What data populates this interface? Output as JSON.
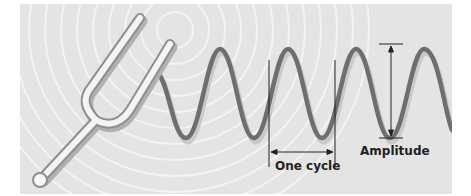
{
  "diagram": {
    "labels": {
      "one_cycle": "One cycle",
      "amplitude": "Amplitude"
    },
    "elements": [
      {
        "name": "tuning-fork",
        "type": "illustration"
      },
      {
        "name": "concentric-sound-rings",
        "type": "background"
      },
      {
        "name": "sine-wave",
        "type": "wave",
        "cycles_visible": 4.5
      },
      {
        "name": "cycle-marker",
        "type": "dimension",
        "label": "One cycle"
      },
      {
        "name": "amplitude-marker",
        "type": "dimension",
        "label": "Amplitude"
      }
    ],
    "colors": {
      "background_panel": "#e4e4e4",
      "rings": "#f4f4f4",
      "wave": "#6e6e6e",
      "wave_shadow": "#c8c8c8",
      "fork_fill": "#f2f2f2",
      "fork_outline": "#9a9a9a",
      "annotation": "#222222"
    }
  }
}
